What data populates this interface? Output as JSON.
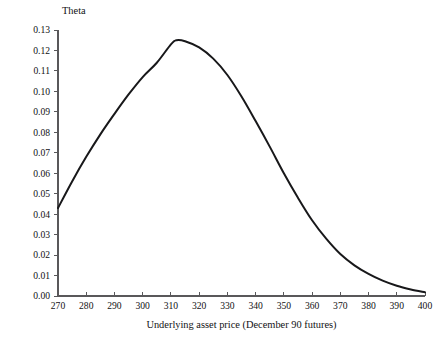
{
  "chart_data": {
    "type": "line",
    "title": "",
    "subtitle": "",
    "xlabel": "Underlying asset price (December 90 futures)",
    "ylabel": "Theta",
    "xlim": [
      270,
      400
    ],
    "ylim": [
      0.0,
      0.13
    ],
    "grid": false,
    "legend": null,
    "legend_position": "none",
    "xticks": [
      270,
      280,
      290,
      300,
      310,
      320,
      330,
      340,
      350,
      360,
      370,
      380,
      390,
      400
    ],
    "xticklabels": [
      "270",
      "280",
      "290",
      "300",
      "310",
      "320",
      "330",
      "340",
      "350",
      "360",
      "370",
      "380",
      "390",
      "400"
    ],
    "yticks": [
      0.0,
      0.01,
      0.02,
      0.03,
      0.04,
      0.05,
      0.06,
      0.07,
      0.08,
      0.09,
      0.1,
      0.11,
      0.12,
      0.13
    ],
    "yticklabels": [
      "0.00",
      "0.01",
      "0.02",
      "0.03",
      "0.04",
      "0.05",
      "0.06",
      "0.07",
      "0.08",
      "0.09",
      "0.10",
      "0.11",
      "0.12",
      "0.13"
    ],
    "series": [
      {
        "name": "Theta",
        "color": "#18181a",
        "x": [
          270,
          275,
          280,
          285,
          290,
          295,
          300,
          305,
          310,
          312,
          315,
          320,
          325,
          330,
          335,
          340,
          345,
          350,
          355,
          360,
          365,
          370,
          375,
          380,
          385,
          390,
          395,
          400
        ],
        "y": [
          0.043,
          0.056,
          0.068,
          0.079,
          0.089,
          0.0985,
          0.107,
          0.114,
          0.123,
          0.125,
          0.1245,
          0.1215,
          0.116,
          0.108,
          0.0975,
          0.0855,
          0.073,
          0.06,
          0.048,
          0.037,
          0.028,
          0.0205,
          0.015,
          0.0108,
          0.0075,
          0.005,
          0.0032,
          0.0018
        ]
      }
    ],
    "annotations": []
  },
  "geometry": {
    "plot_left": 58,
    "plot_right": 425,
    "plot_top": 30,
    "plot_bottom": 296
  },
  "labels": {
    "y_axis_title": "Theta",
    "x_axis_title": "Underlying asset price (December 90 futures)"
  }
}
